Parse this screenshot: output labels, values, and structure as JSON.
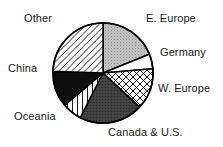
{
  "chart_data": {
    "type": "pie",
    "title": "",
    "subtitle": "",
    "xlabel": "",
    "ylabel": "",
    "grid": false,
    "legend_position": "around-slices",
    "label_placement": "outside",
    "start_angle_deg": 0,
    "direction": "clockwise",
    "center": {
      "cx": 103,
      "cy": 73,
      "r": 50
    },
    "categories": [
      "E. Europe",
      "Germany",
      "W. Europe",
      "Canada & U.S.",
      "Oceania",
      "China",
      "Other"
    ],
    "values": [
      19,
      5,
      13,
      21,
      6,
      12,
      24
    ],
    "slices": [
      {
        "label": "E. Europe",
        "value": 19,
        "start_deg": 0,
        "end_deg": 68,
        "fill_style": "light-gray-stipple",
        "fill_color": "#bfbfbf",
        "stroke_color": "#000000"
      },
      {
        "label": "Germany",
        "value": 5,
        "start_deg": 68,
        "end_deg": 85,
        "fill_style": "solid-white",
        "fill_color": "#ffffff",
        "stroke_color": "#000000"
      },
      {
        "label": "W. Europe",
        "value": 13,
        "start_deg": 85,
        "end_deg": 133,
        "fill_style": "cross-hatch",
        "fill_color": "#ffffff",
        "stroke_color": "#000000"
      },
      {
        "label": "Canada & U.S.",
        "value": 21,
        "start_deg": 133,
        "end_deg": 207,
        "fill_style": "dark-charcoal",
        "fill_color": "#3d3d3d",
        "stroke_color": "#000000"
      },
      {
        "label": "Oceania",
        "value": 6,
        "start_deg": 207,
        "end_deg": 230,
        "fill_style": "vertical-line-hatch",
        "fill_color": "#ffffff",
        "stroke_color": "#000000"
      },
      {
        "label": "China",
        "value": 12,
        "start_deg": 230,
        "end_deg": 272,
        "fill_style": "solid-black",
        "fill_color": "#0d0d0d",
        "stroke_color": "#000000"
      },
      {
        "label": "Other",
        "value": 24,
        "start_deg": 272,
        "end_deg": 360,
        "fill_style": "diagonal-hatch",
        "fill_color": "#ffffff",
        "stroke_color": "#000000"
      }
    ],
    "labels": [
      {
        "text": "Other",
        "x": 24,
        "y": 12
      },
      {
        "text": "E. Europe",
        "x": 146,
        "y": 12
      },
      {
        "text": "Germany",
        "x": 160,
        "y": 46
      },
      {
        "text": "W. Europe",
        "x": 158,
        "y": 82
      },
      {
        "text": "Canada & U.S.",
        "x": 108,
        "y": 126
      },
      {
        "text": "Oceania",
        "x": 14,
        "y": 110
      },
      {
        "text": "China",
        "x": 8,
        "y": 62
      }
    ],
    "colors": {
      "outline": "#000000",
      "background": "#ffffff",
      "text": "#1a1a1a",
      "light_gray": "#bfbfbf",
      "dark_gray": "#3d3d3d",
      "black": "#0d0d0d"
    }
  }
}
